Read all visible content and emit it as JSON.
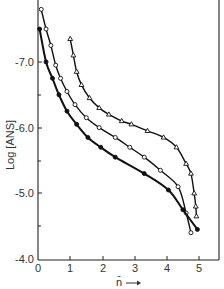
{
  "chart_data": {
    "type": "line",
    "title": "",
    "xlabel": "n̄ →",
    "ylabel": "Log [ANS]",
    "xlim": [
      0,
      5.6
    ],
    "ylim": [
      -4.0,
      -7.9
    ],
    "y_inverted": true,
    "x_ticks": [
      "0",
      "1",
      "2",
      "3",
      "4",
      "5"
    ],
    "y_ticks": [
      "-7.0",
      "-6.0",
      "-5.0",
      "-4.0"
    ],
    "grid": false,
    "legend": null,
    "series": [
      {
        "name": "open-triangle",
        "marker": "triangle-open",
        "points": [
          [
            1.0,
            -7.35
          ],
          [
            1.1,
            -7.1
          ],
          [
            1.2,
            -6.85
          ],
          [
            1.35,
            -6.65
          ],
          [
            1.6,
            -6.45
          ],
          [
            1.9,
            -6.3
          ],
          [
            2.2,
            -6.2
          ],
          [
            2.6,
            -6.1
          ],
          [
            2.9,
            -6.05
          ],
          [
            3.4,
            -5.95
          ],
          [
            3.9,
            -5.85
          ],
          [
            4.3,
            -5.7
          ],
          [
            4.6,
            -5.45
          ],
          [
            4.75,
            -5.3
          ],
          [
            4.85,
            -5.0
          ],
          [
            4.9,
            -4.8
          ],
          [
            4.92,
            -4.65
          ]
        ]
      },
      {
        "name": "open-circle",
        "marker": "circle-open",
        "points": [
          [
            0.1,
            -7.8
          ],
          [
            0.25,
            -7.5
          ],
          [
            0.4,
            -7.25
          ],
          [
            0.55,
            -6.95
          ],
          [
            0.7,
            -6.75
          ],
          [
            0.9,
            -6.55
          ],
          [
            1.15,
            -6.35
          ],
          [
            1.5,
            -6.15
          ],
          [
            1.9,
            -6.0
          ],
          [
            2.4,
            -5.85
          ],
          [
            2.85,
            -5.7
          ],
          [
            3.3,
            -5.55
          ],
          [
            3.8,
            -5.35
          ],
          [
            4.35,
            -5.1
          ],
          [
            4.6,
            -4.7
          ],
          [
            4.75,
            -4.4
          ]
        ]
      },
      {
        "name": "filled-circle",
        "marker": "circle-filled",
        "points": [
          [
            0.05,
            -7.5
          ],
          [
            0.25,
            -7.0
          ],
          [
            0.45,
            -6.75
          ],
          [
            0.65,
            -6.5
          ],
          [
            0.9,
            -6.25
          ],
          [
            1.2,
            -6.05
          ],
          [
            1.55,
            -5.85
          ],
          [
            1.95,
            -5.7
          ],
          [
            2.4,
            -5.55
          ],
          [
            3.3,
            -5.3
          ],
          [
            4.05,
            -5.05
          ],
          [
            4.5,
            -4.75
          ],
          [
            4.95,
            -4.45
          ]
        ]
      }
    ]
  },
  "axes": {
    "ylabel": "Log [ANS]",
    "xlabel": "n̄",
    "xlabel_arrow": "→",
    "y_tick_labels": [
      "-7.0",
      "-6.0",
      "-5.0",
      "-4.0"
    ],
    "x_tick_labels": [
      "0",
      "1",
      "2",
      "3",
      "4",
      "5"
    ]
  }
}
